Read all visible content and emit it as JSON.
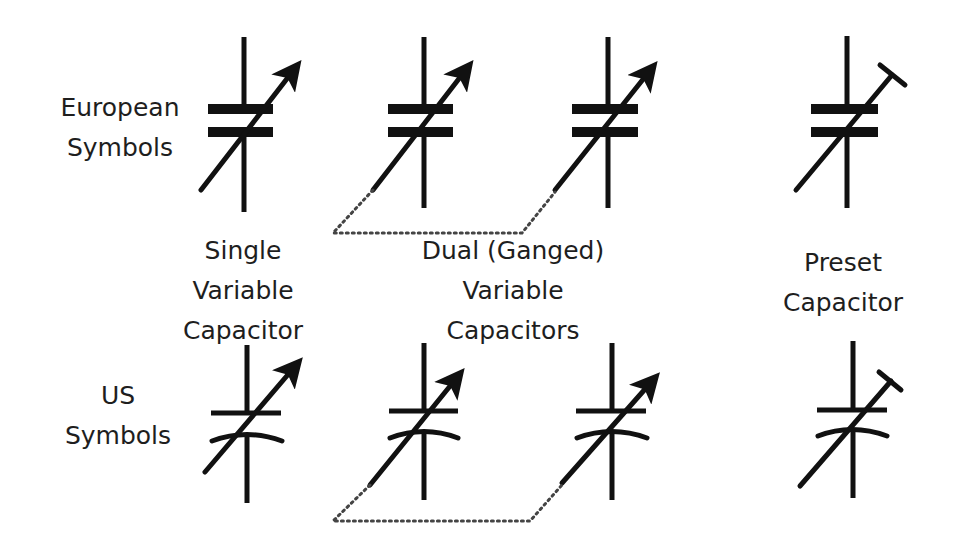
{
  "row_labels": {
    "european": [
      "European",
      "Symbols"
    ],
    "us": [
      "US",
      "Symbols"
    ]
  },
  "column_labels": {
    "single": [
      "Single",
      "Variable",
      "Capacitor"
    ],
    "dual": [
      "Dual (Ganged)",
      "Variable",
      "Capacitors"
    ],
    "preset": [
      "Preset",
      "Capacitor"
    ]
  },
  "colors": {
    "stroke": "#111111",
    "text": "#1e1e1e",
    "background": "#ffffff",
    "gang_link": "#444444"
  },
  "symbols": [
    {
      "row": "european",
      "type": "single-variable",
      "adjuster": "arrow"
    },
    {
      "row": "european",
      "type": "dual-ganged-variable-a",
      "adjuster": "arrow"
    },
    {
      "row": "european",
      "type": "dual-ganged-variable-b",
      "adjuster": "arrow"
    },
    {
      "row": "european",
      "type": "preset",
      "adjuster": "t-bar"
    },
    {
      "row": "us",
      "type": "single-variable",
      "adjuster": "arrow"
    },
    {
      "row": "us",
      "type": "dual-ganged-variable-a",
      "adjuster": "arrow"
    },
    {
      "row": "us",
      "type": "dual-ganged-variable-b",
      "adjuster": "arrow"
    },
    {
      "row": "us",
      "type": "preset",
      "adjuster": "t-bar"
    }
  ]
}
